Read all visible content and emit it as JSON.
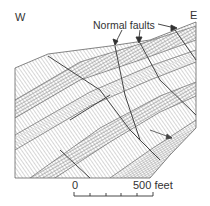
{
  "figure": {
    "type": "geologic-cross-section",
    "orientation": {
      "west_label": "W",
      "east_label": "E"
    },
    "annotation": {
      "text": "Normal faults",
      "arrow_count": 3
    },
    "scale_bar": {
      "start_label": "0",
      "end_label": "500 feet",
      "tick_count": 5
    },
    "colors": {
      "line": "#555555",
      "hatch": "#8a8a8a",
      "background": "#ffffff",
      "text": "#333333"
    }
  }
}
